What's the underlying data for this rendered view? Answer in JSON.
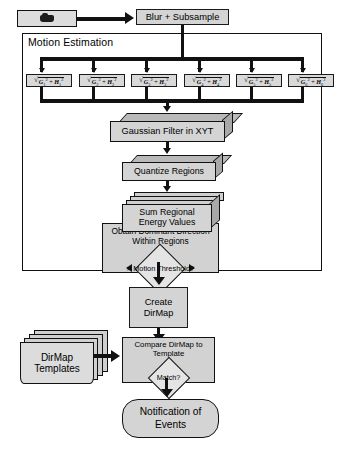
{
  "diagram": {
    "colors": {
      "box_fill": "#d4d4d4",
      "panel_fill": "#d2d2d2",
      "stack_top": "#b9b9b9",
      "stack_side": "#a8a8a8",
      "outline": "#111111",
      "background": "#ffffff"
    },
    "source": {
      "icon": "video-camera-icon",
      "label": ""
    },
    "blur_subsample": {
      "label": "Blur + Subsample"
    },
    "motion_estimation": {
      "label": "Motion Estimation",
      "filters": [
        {
          "label": "sqrt(G1^2 + H1^2)",
          "g": "G",
          "h": "H",
          "index": "1"
        },
        {
          "label": "sqrt(G2^2 + H2^2)",
          "g": "G",
          "h": "H",
          "index": "2"
        },
        {
          "label": "sqrt(G3^2 + H3^2)",
          "g": "G",
          "h": "H",
          "index": "3"
        },
        {
          "label": "sqrt(G4^2 + H4^2)",
          "g": "G",
          "h": "H",
          "index": "4"
        },
        {
          "label": "sqrt(G5^2 + H5^2)",
          "g": "G",
          "h": "H",
          "index": "5"
        },
        {
          "label": "sqrt(G6^2 + H6^2)",
          "g": "G",
          "h": "H",
          "index": "6"
        }
      ],
      "gaussian_filter": {
        "label": "Gaussian Filter in XYT"
      },
      "quantize_regions": {
        "label": "Quantize Regions"
      },
      "sum_regional": {
        "line1": "Sum Regional",
        "line2": "Energy Values"
      },
      "dominant_direction": {
        "line1": "Obtain Dominant Direction",
        "line2": "Within Regions",
        "decision": "> Motion Threshold?"
      }
    },
    "create_dirmap": {
      "line1": "Create",
      "line2": "DirMap"
    },
    "dirmap_templates": {
      "line1": "DirMap",
      "line2": "Templates"
    },
    "compare": {
      "line1": "Compare DirMap to",
      "line2": "Template",
      "decision": "Match?"
    },
    "notification": {
      "line1": "Notification of",
      "line2": "Events"
    }
  }
}
